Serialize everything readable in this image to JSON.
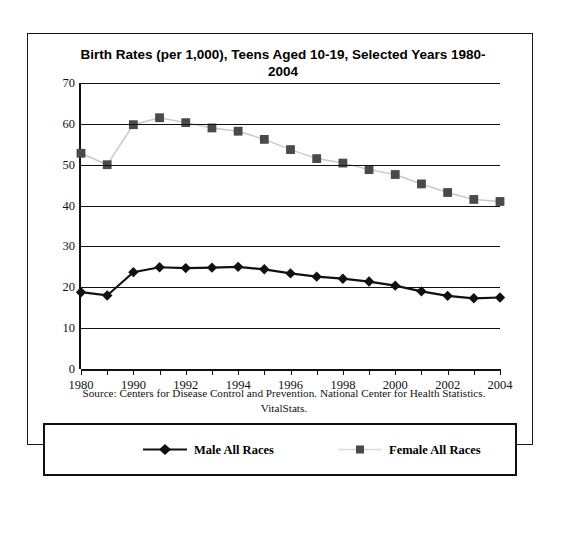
{
  "chart_data": {
    "type": "line",
    "title": "Birth Rates (per 1,000), Teens Aged 10-19, Selected Years 1980-2004",
    "xlabel": "",
    "ylabel": "Birth Rate per 1,000",
    "ylim": [
      0,
      70
    ],
    "ytick_step": 10,
    "yticks": [
      0,
      10,
      20,
      30,
      40,
      50,
      60,
      70
    ],
    "grid": true,
    "legend_position": "bottom",
    "categories": [
      "1980",
      "1989",
      "1990",
      "1991",
      "1992",
      "1993",
      "1994",
      "1995",
      "1996",
      "1997",
      "1998",
      "1999",
      "2000",
      "2001",
      "2002",
      "2003",
      "2004"
    ],
    "xtick_labels": [
      "1980",
      "1990",
      "1992",
      "1994",
      "1996",
      "1998",
      "2000",
      "2002",
      "2004"
    ],
    "xtick_label_indices": [
      0,
      2,
      4,
      6,
      8,
      10,
      12,
      14,
      16
    ],
    "series": [
      {
        "name": "Male All Races",
        "marker": "diamond",
        "color": "#111111",
        "line_color": "#111111",
        "values": [
          18.8,
          18.0,
          23.7,
          24.9,
          24.7,
          24.8,
          25.0,
          24.4,
          23.4,
          22.6,
          22.1,
          21.4,
          20.4,
          19.0,
          17.9,
          17.3,
          17.5
        ]
      },
      {
        "name": "Female All Races",
        "marker": "square",
        "color": "#4a4a4a",
        "line_color": "#c9c9c9",
        "values": [
          52.8,
          50.0,
          59.8,
          61.5,
          60.3,
          59.0,
          58.2,
          56.2,
          53.7,
          51.5,
          50.4,
          48.8,
          47.6,
          45.3,
          43.2,
          41.5,
          41.0
        ]
      }
    ],
    "source_note": "Source: Centers for Disease Control and Prevention. National Center for Health Statistics. VitalStats."
  },
  "legend": {
    "items": [
      {
        "label": "Male All Races"
      },
      {
        "label": "Female All Races"
      }
    ]
  }
}
